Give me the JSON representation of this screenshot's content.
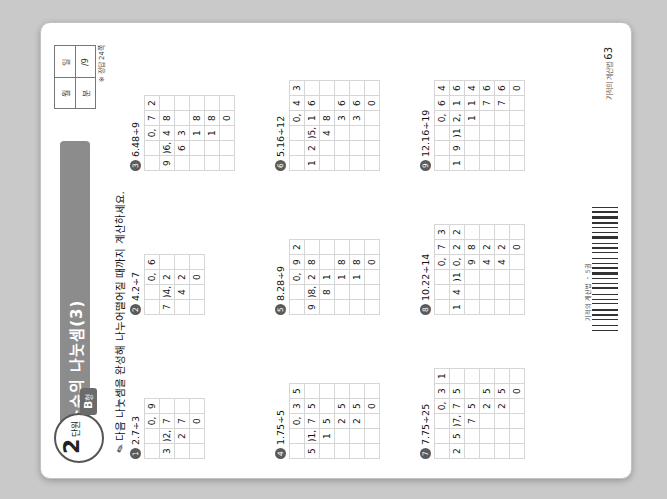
{
  "page": {
    "chapter_number": "2",
    "chapter_label": "단원",
    "level_tag": "B",
    "level_tag_sub": "형",
    "title": "소수의 나눗셈(3)",
    "instruction": "다음 나눗셈을 완성해 나누어떨어질 때까지 계산하세요.",
    "pencil_icon": "pencil-icon",
    "answer_box": {
      "label_left_top": "월",
      "label_right_top": "일",
      "label_left_bottom": "분",
      "label_right_bottom": "/9"
    },
    "answer_note": "※ 정답 24쪽",
    "page_number": "63",
    "page_number_prefix": "기적의 계산법",
    "footer_tag": "기적의 계산법 ・ 5권"
  },
  "problems": [
    {
      "num": "①",
      "expr": "2.7÷3",
      "rows": [
        [
          "",
          "",
          "0,",
          "9"
        ],
        [
          "3",
          ")2,",
          "7",
          ""
        ],
        [
          "",
          "2",
          "7",
          ""
        ],
        [
          "",
          "",
          "0",
          ""
        ]
      ]
    },
    {
      "num": "②",
      "expr": "4.2÷7",
      "rows": [
        [
          "",
          "",
          "0,",
          "6"
        ],
        [
          "7",
          ")4,",
          "2",
          ""
        ],
        [
          "",
          "4",
          "2",
          ""
        ],
        [
          "",
          "",
          "0",
          ""
        ]
      ]
    },
    {
      "num": "③",
      "expr": "6.48÷9",
      "rows": [
        [
          "",
          "",
          "0,",
          "7",
          "2"
        ],
        [
          "9",
          ")6,",
          "4",
          "8",
          ""
        ],
        [
          "",
          "6",
          "3",
          "",
          ""
        ],
        [
          "",
          "",
          "1",
          "8",
          ""
        ],
        [
          "",
          "",
          "1",
          "8",
          ""
        ],
        [
          "",
          "",
          "",
          "0",
          ""
        ]
      ]
    },
    {
      "num": "④",
      "expr": "1.75÷5",
      "rows": [
        [
          "",
          "",
          "0,",
          "3",
          "5"
        ],
        [
          "5",
          ")1,",
          "7",
          "5",
          ""
        ],
        [
          "",
          "1",
          "5",
          "",
          ""
        ],
        [
          "",
          "",
          "2",
          "5",
          ""
        ],
        [
          "",
          "",
          "2",
          "5",
          ""
        ],
        [
          "",
          "",
          "",
          "0",
          ""
        ]
      ]
    },
    {
      "num": "⑤",
      "expr": "8.28÷9",
      "rows": [
        [
          "",
          "",
          "0,",
          "9",
          "2"
        ],
        [
          "9",
          ")8,",
          "2",
          "8",
          ""
        ],
        [
          "",
          "8",
          "1",
          "",
          ""
        ],
        [
          "",
          "",
          "1",
          "8",
          ""
        ],
        [
          "",
          "",
          "1",
          "8",
          ""
        ],
        [
          "",
          "",
          "",
          "0",
          ""
        ]
      ]
    },
    {
      "num": "⑥",
      "expr": "5.16÷12",
      "rows": [
        [
          "",
          "",
          "",
          "0,",
          "4",
          "3"
        ],
        [
          "1",
          "2",
          ")5,",
          "1",
          "6",
          ""
        ],
        [
          "",
          "",
          "4",
          "8",
          "",
          ""
        ],
        [
          "",
          "",
          "",
          "3",
          "6",
          ""
        ],
        [
          "",
          "",
          "",
          "3",
          "6",
          ""
        ],
        [
          "",
          "",
          "",
          "",
          "0",
          ""
        ]
      ]
    },
    {
      "num": "⑦",
      "expr": "7.75÷25",
      "rows": [
        [
          "",
          "",
          "",
          "0,",
          "3",
          "1"
        ],
        [
          "2",
          "5",
          ")7,",
          "7",
          "5",
          ""
        ],
        [
          "",
          "",
          "7",
          "5",
          "",
          ""
        ],
        [
          "",
          "",
          "",
          "2",
          "5",
          ""
        ],
        [
          "",
          "",
          "",
          "2",
          "5",
          ""
        ],
        [
          "",
          "",
          "",
          "",
          "0",
          ""
        ]
      ]
    },
    {
      "num": "⑧",
      "expr": "10.22÷14",
      "rows": [
        [
          "",
          "",
          "",
          "0,",
          "7",
          "3"
        ],
        [
          "1",
          "4",
          ")1",
          "0,",
          "2",
          "2"
        ],
        [
          "",
          "",
          "",
          "9",
          "8",
          ""
        ],
        [
          "",
          "",
          "",
          "4",
          "2",
          ""
        ],
        [
          "",
          "",
          "",
          "4",
          "2",
          ""
        ],
        [
          "",
          "",
          "",
          "",
          "0",
          ""
        ]
      ]
    },
    {
      "num": "⑨",
      "expr": "12.16÷19",
      "rows": [
        [
          "",
          "",
          "",
          "0,",
          "6",
          "4"
        ],
        [
          "1",
          "9",
          ")1",
          "2,",
          "1",
          "6"
        ],
        [
          "",
          "",
          "",
          "1",
          "1",
          "4"
        ],
        [
          "",
          "",
          "",
          "",
          "7",
          "6"
        ],
        [
          "",
          "",
          "",
          "",
          "7",
          "6"
        ],
        [
          "",
          "",
          "",
          "",
          "",
          "0"
        ]
      ]
    }
  ],
  "colors": {
    "band": "#8c8c8c",
    "tag": "#6b6b6b",
    "grid_line": "#d6d6d6",
    "rule": "#555555"
  }
}
